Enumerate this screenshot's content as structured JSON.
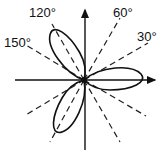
{
  "diagram": {
    "type": "polar-rose",
    "petals": 3,
    "petal_directions_deg": [
      0,
      120,
      240
    ],
    "reference_angles_deg": [
      30,
      60,
      120,
      150
    ],
    "labels": {
      "a30": "30°",
      "a60": "60°",
      "a120": "120°",
      "a150": "150°"
    },
    "colors": {
      "stroke": "#111111",
      "background": "#ffffff"
    }
  }
}
